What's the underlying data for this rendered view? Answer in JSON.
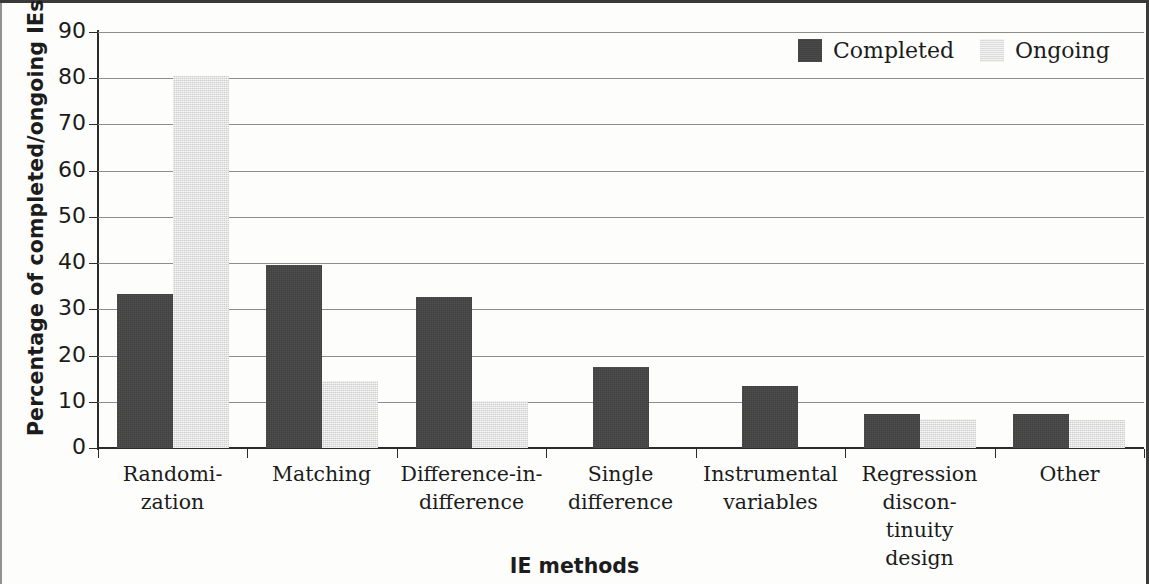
{
  "chart_data": {
    "type": "bar",
    "title": "",
    "xlabel": "IE methods",
    "ylabel": "Percentage  of completed/ongoing IEs",
    "ylim": [
      0,
      90
    ],
    "ytick_step": 10,
    "yticks": [
      90,
      80,
      70,
      60,
      50,
      40,
      30,
      20,
      10,
      0
    ],
    "grid": true,
    "legend_position": "top-right",
    "categories": [
      "Randomi-\nzation",
      "Matching",
      "Difference-in-\ndifference",
      "Single\ndifference",
      "Instrumental\nvariables",
      "Regression\ndiscon-\ntinuity\ndesign",
      "Other"
    ],
    "category_lines": [
      [
        "Randomi-",
        "zation"
      ],
      [
        "Matching"
      ],
      [
        "Difference-in-",
        "difference"
      ],
      [
        "Single",
        "difference"
      ],
      [
        "Instrumental",
        "variables"
      ],
      [
        "Regression",
        "discon-",
        "tinuity",
        "design"
      ],
      [
        "Other"
      ]
    ],
    "series": [
      {
        "name": "Completed",
        "color": "#434343",
        "values": [
          33.3,
          39.6,
          32.7,
          17.5,
          13.5,
          7.3,
          7.3
        ]
      },
      {
        "name": "Ongoing",
        "color": "#e2e2e2",
        "values": [
          80.4,
          14.5,
          10.2,
          0,
          0,
          6.2,
          6.0
        ]
      }
    ]
  },
  "legend": {
    "entries": [
      {
        "label": "Completed"
      },
      {
        "label": "Ongoing"
      }
    ]
  },
  "axes": {
    "y_title": "Percentage  of completed/ongoing IEs",
    "x_title": "IE methods"
  }
}
